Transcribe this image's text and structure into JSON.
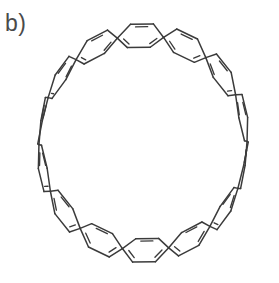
{
  "figure": {
    "panel_label": "b)",
    "caption_text": "",
    "background_color": "#ffffff",
    "line_color": "#3b3b3b",
    "label_color": "#4a4a4a"
  },
  "chart_data": {
    "type": "diagram",
    "title": "b)",
    "structure": "cycloparaphenylene-type carbon nanohoop (fused benzenoid macrocycle) drawn in perspective",
    "ring_count": 14,
    "ring_type": "benzene (six-membered aromatic)",
    "aromatic_inner_lines_per_ring": 3,
    "view": "tilted ellipse, hollow center",
    "geometry": {
      "center_x": 143,
      "center_y": 143,
      "hoop_radius_x": 104,
      "hoop_radius_y": 108,
      "tilt_degrees": -8,
      "band_half_width": 27,
      "vertical_squash": 0.42,
      "start_angle_degrees": -96
    },
    "xlabel": "",
    "ylabel": "",
    "grid": false,
    "legend": null
  }
}
